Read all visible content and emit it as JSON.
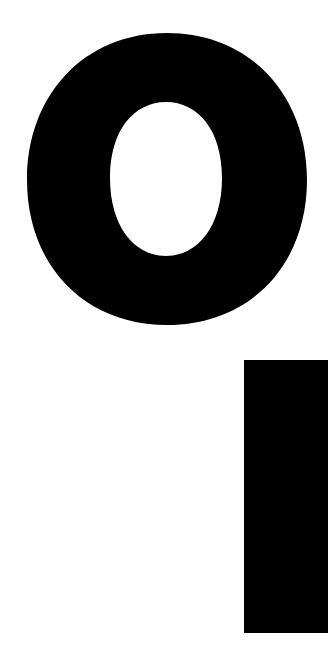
{
  "image": {
    "description": "Black letter O above a black vertical bar on white background",
    "colors": {
      "foreground": "#000000",
      "background": "#ffffff"
    },
    "shapes": [
      {
        "name": "letter-o",
        "outer": {
          "x": 27,
          "y": 33,
          "w": 280,
          "h": 292
        },
        "inner": {
          "x": 110,
          "y": 102,
          "w": 112,
          "h": 154
        }
      },
      {
        "name": "vertical-bar",
        "x": 244,
        "y": 360,
        "w": 84,
        "h": 273
      }
    ]
  }
}
